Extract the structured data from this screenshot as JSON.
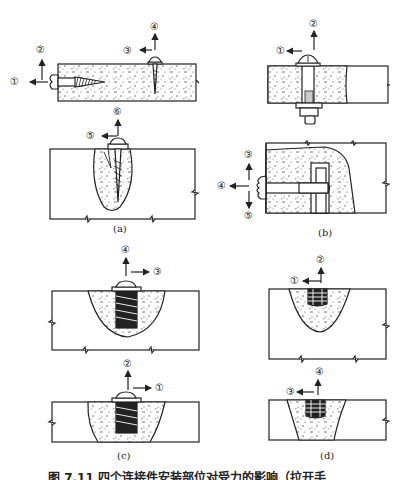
{
  "figure": {
    "caption": "图 7.11  四个连接件安装部位对受力的影响（拉开手",
    "panels": [
      {
        "id": "a",
        "label": "(a)",
        "markers": [
          "①",
          "②",
          "③",
          "④",
          "⑤",
          "⑥"
        ]
      },
      {
        "id": "b",
        "label": "(b)",
        "markers": [
          "①",
          "②",
          "③",
          "④",
          "⑤"
        ]
      },
      {
        "id": "c",
        "label": "(c)",
        "markers": [
          "①",
          "②",
          "③",
          "④"
        ]
      },
      {
        "id": "d",
        "label": "(d)",
        "markers": [
          "①",
          "②",
          "③",
          "④"
        ]
      }
    ]
  },
  "markers": {
    "a1": "①",
    "a2": "②",
    "a3": "③",
    "a4": "④",
    "a5": "⑤",
    "a6": "⑥",
    "b1": "①",
    "b2": "②",
    "b3": "③",
    "b4": "④",
    "b5": "⑤",
    "c1": "①",
    "c2": "②",
    "c3": "③",
    "c4": "④",
    "d1": "①",
    "d2": "②",
    "d3": "③",
    "d4": "④"
  },
  "labels": {
    "a": "(a)",
    "b": "(b)",
    "c": "(c)",
    "d": "(d)"
  },
  "colors": {
    "ink": "#222222",
    "fill": "#ffffff",
    "speckle": "#555555"
  }
}
